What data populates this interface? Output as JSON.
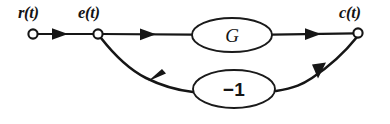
{
  "diagram": {
    "type": "signal-flow-graph",
    "background_color": "#ffffff",
    "stroke_color": "#161616",
    "nodes": [
      {
        "id": "r",
        "label": "r(t)",
        "x": 33,
        "y": 34,
        "radius": 4.6,
        "label_x": 18,
        "label_y": 18
      },
      {
        "id": "e",
        "label": "e(t)",
        "x": 98,
        "y": 34,
        "radius": 4.6,
        "label_x": 78,
        "label_y": 18
      },
      {
        "id": "c",
        "label": "c(t)",
        "x": 358,
        "y": 33,
        "radius": 4.6,
        "label_x": 339,
        "label_y": 18
      }
    ],
    "blocks": [
      {
        "id": "forward-gain",
        "label": "G",
        "cx": 232,
        "cy": 35,
        "rx": 40,
        "ry": 17
      },
      {
        "id": "feedback-gain",
        "label": "−1",
        "cx": 234,
        "cy": 89,
        "rx": 41,
        "ry": 19
      }
    ],
    "edges": [
      {
        "id": "r-to-e",
        "from": "r",
        "to": "e",
        "arrow_label": "forward",
        "direction": "right"
      },
      {
        "id": "e-to-g",
        "from": "e",
        "to": "forward-gain",
        "arrow_label": "forward",
        "direction": "right"
      },
      {
        "id": "g-to-c",
        "from": "forward-gain",
        "to": "c",
        "arrow_label": "forward",
        "direction": "right"
      },
      {
        "id": "c-to-feedback",
        "from": "c",
        "to": "feedback-gain",
        "arrow_label": "feedback",
        "direction": "down-left"
      },
      {
        "id": "feedback-to-e",
        "from": "feedback-gain",
        "to": "e",
        "arrow_label": "feedback",
        "direction": "up-left"
      }
    ]
  }
}
